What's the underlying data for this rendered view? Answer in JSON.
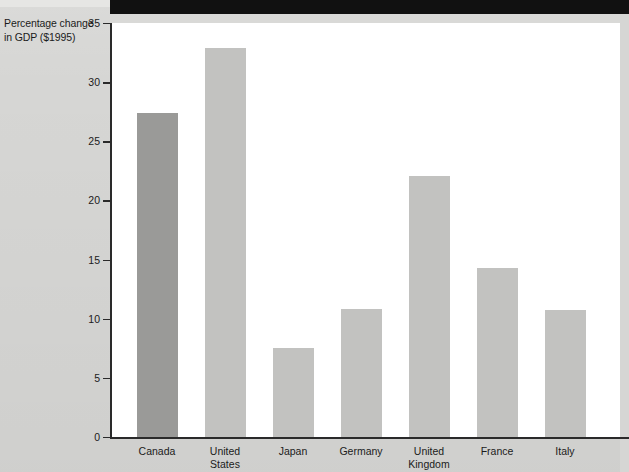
{
  "figure": {
    "background_color": "#d6d6d4",
    "plot_background_color": "#ffffff",
    "banner_color": "#111111"
  },
  "axis": {
    "y_title_line1": "Percentage change",
    "y_title_line2": "in GDP ($1995)"
  },
  "chart_data": {
    "type": "bar",
    "title": "",
    "xlabel": "",
    "ylabel": "Percentage change in GDP ($1995)",
    "ylim": [
      0,
      35
    ],
    "yticks": [
      0,
      5,
      10,
      15,
      20,
      25,
      30,
      35
    ],
    "ytick_labels": [
      "0",
      "5",
      "10",
      "15",
      "20",
      "25",
      "30",
      "35"
    ],
    "grid": false,
    "legend": null,
    "categories": [
      "Canada",
      "United\nStates",
      "Japan",
      "Germany",
      "United\nKingdom",
      "France",
      "Italy"
    ],
    "values": [
      27.4,
      32.9,
      7.5,
      10.8,
      22.1,
      14.3,
      10.7
    ],
    "bar_colors": [
      "#9a9a98",
      "#c2c2c0",
      "#c2c2c0",
      "#c2c2c0",
      "#c2c2c0",
      "#c2c2c0",
      "#c2c2c0"
    ],
    "highlight_index": 0,
    "series": [
      {
        "name": "Percentage change in GDP ($1995)",
        "values": [
          27.4,
          32.9,
          7.5,
          10.8,
          22.1,
          14.3,
          10.7
        ]
      }
    ]
  }
}
